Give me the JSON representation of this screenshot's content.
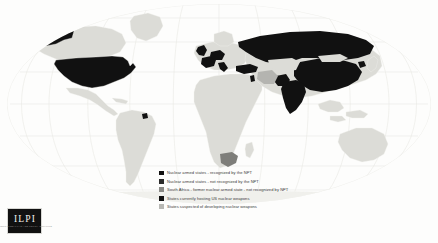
{
  "figure": {
    "background_color": "#fdfdfc"
  },
  "map": {
    "projection": "robinson",
    "graticule_color": "#e7e7e2",
    "ocean_color": "#fdfdfc",
    "default_land_color": "#dcdcd7",
    "land_outline_color": "#f4f4f1"
  },
  "palette": {
    "nuclear_npt": "#111111",
    "nuclear_non_npt": "#111111",
    "south_africa_former": "#7e7e7a",
    "hosting_us_weapons": "#111111",
    "suspected_developing": "#b4b4b0",
    "other_land": "#dcdcd7"
  },
  "legend": {
    "items": [
      {
        "swatch_name": "legend-swatch-nuclear-npt",
        "color": "#111111",
        "label": "Nuclear armed states - recognized by the NPT"
      },
      {
        "swatch_name": "legend-swatch-nuclear-non-npt",
        "color": "#2b2b2b",
        "label": "Nuclear armed states - not recognized by the NPT"
      },
      {
        "swatch_name": "legend-swatch-south-africa",
        "color": "#8a8a86",
        "label": "South Africa - former nuclear armed state - not recognized by NPT"
      },
      {
        "swatch_name": "legend-swatch-hosting-us",
        "color": "#111111",
        "label": "States currently hosting US nuclear weapons"
      },
      {
        "swatch_name": "legend-swatch-suspected",
        "color": "#b8b8b4",
        "label": "States suspected of developing nuclear weapons"
      }
    ]
  },
  "logo": {
    "mark": "ILPI",
    "subtitle": "INTERNATIONAL LAW AND POLICY INSTITUTE"
  },
  "regions": {
    "nuclear_npt": [
      "United States",
      "Russia",
      "China",
      "United Kingdom",
      "France"
    ],
    "nuclear_non_npt": [
      "India",
      "Pakistan",
      "Israel",
      "North Korea"
    ],
    "former_nuclear": [
      "South Africa"
    ],
    "hosting_us_weapons": [
      "Germany",
      "Belgium",
      "Netherlands",
      "Italy",
      "Turkey"
    ],
    "suspected_developing": [
      "Iran"
    ]
  }
}
